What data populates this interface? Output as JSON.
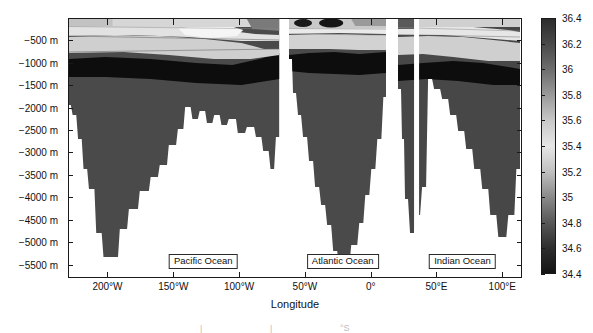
{
  "chart_data": {
    "type": "heatmap",
    "title": "",
    "subtitle": "",
    "xlabel": "Longitude",
    "ylabel": "",
    "colorbar_label": "",
    "grid": false,
    "legend_position": "right-colorbar",
    "xlim": [
      -230,
      115
    ],
    "ylim": [
      -5800,
      0
    ],
    "x_ticks": [
      {
        "value": -200,
        "label": "200°W"
      },
      {
        "value": -150,
        "label": "150°W"
      },
      {
        "value": -100,
        "label": "100°W"
      },
      {
        "value": -50,
        "label": "50°W"
      },
      {
        "value": 0,
        "label": "0°"
      },
      {
        "value": 50,
        "label": "50°E"
      },
      {
        "value": 100,
        "label": "100°E"
      }
    ],
    "y_ticks": [
      {
        "value": -500,
        "label": "−500 m"
      },
      {
        "value": -1000,
        "label": "−1000 m"
      },
      {
        "value": -1500,
        "label": "−1500 m"
      },
      {
        "value": -2000,
        "label": "−2000 m"
      },
      {
        "value": -2500,
        "label": "−2500 m"
      },
      {
        "value": -3000,
        "label": "−3000 m"
      },
      {
        "value": -3500,
        "label": "−3500 m"
      },
      {
        "value": -4000,
        "label": "−4000 m"
      },
      {
        "value": -4500,
        "label": "−4500 m"
      },
      {
        "value": -5000,
        "label": "−5000 m"
      },
      {
        "value": -5500,
        "label": "−5500 m"
      }
    ],
    "colorbar": {
      "ticks": [
        36.4,
        36.2,
        36,
        35.8,
        35.6,
        35.4,
        35.2,
        35,
        34.8,
        34.6,
        34.4
      ],
      "tick_labels": [
        "36.4",
        "36.2",
        "36",
        "35.8",
        "35.6",
        "35.4",
        "35.2",
        "35",
        "34.8",
        "34.6",
        "34.4"
      ],
      "vmin": 34.4,
      "vmax": 36.4,
      "colormap": "grayscale-nonmonotonic",
      "stops": [
        {
          "value": 36.4,
          "color": "#2c2c2c"
        },
        {
          "value": 36.2,
          "color": "#4a4a4a"
        },
        {
          "value": 36.0,
          "color": "#6e6e6e"
        },
        {
          "value": 35.8,
          "color": "#9a9a9a"
        },
        {
          "value": 35.6,
          "color": "#c8c8c8"
        },
        {
          "value": 35.4,
          "color": "#e6e6e6"
        },
        {
          "value": 35.2,
          "color": "#c0c0c0"
        },
        {
          "value": 35.0,
          "color": "#8a8a8a"
        },
        {
          "value": 34.8,
          "color": "#585858"
        },
        {
          "value": 34.6,
          "color": "#2e2e2e"
        },
        {
          "value": 34.4,
          "color": "#141414"
        }
      ]
    },
    "panels": [
      {
        "name": "Pacific Ocean",
        "label": "Pacific Ocean",
        "x_start": -230,
        "x_end": -70,
        "label_x": -128,
        "label_y": -5250,
        "max_depth_m": 5550,
        "water_mass_bands": [
          {
            "depth_top_m": 0,
            "depth_bottom_m": 150,
            "salinity": 35.0
          },
          {
            "depth_top_m": 150,
            "depth_bottom_m": 500,
            "salinity": 35.4
          },
          {
            "depth_top_m": 500,
            "depth_bottom_m": 800,
            "salinity": 34.9
          },
          {
            "depth_top_m": 800,
            "depth_bottom_m": 1250,
            "salinity": 34.45
          },
          {
            "depth_top_m": 1250,
            "depth_bottom_m": 5550,
            "salinity": 34.7
          }
        ]
      },
      {
        "name": "Atlantic Ocean",
        "label": "Atlantic Ocean",
        "x_start": -63,
        "x_end": 11,
        "label_x": -22,
        "label_y": -5250,
        "max_depth_m": 5500,
        "water_mass_bands": [
          {
            "depth_top_m": 0,
            "depth_bottom_m": 120,
            "salinity": 36.3
          },
          {
            "depth_top_m": 120,
            "depth_bottom_m": 420,
            "salinity": 35.45
          },
          {
            "depth_top_m": 420,
            "depth_bottom_m": 700,
            "salinity": 35.0
          },
          {
            "depth_top_m": 700,
            "depth_bottom_m": 1150,
            "salinity": 34.45
          },
          {
            "depth_top_m": 1150,
            "depth_bottom_m": 5500,
            "salinity": 34.75
          }
        ]
      },
      {
        "name": "Indian Ocean",
        "label": "Indian Ocean",
        "x_start": 20,
        "x_end": 113,
        "label_x": 69,
        "label_y": -5250,
        "max_depth_m": 5300,
        "water_mass_bands": [
          {
            "depth_top_m": 0,
            "depth_bottom_m": 110,
            "salinity": 35.5
          },
          {
            "depth_top_m": 110,
            "depth_bottom_m": 480,
            "salinity": 35.45
          },
          {
            "depth_top_m": 480,
            "depth_bottom_m": 900,
            "salinity": 34.9
          },
          {
            "depth_top_m": 900,
            "depth_bottom_m": 1300,
            "salinity": 34.45
          },
          {
            "depth_top_m": 1300,
            "depth_bottom_m": 5300,
            "salinity": 34.75
          }
        ]
      }
    ]
  },
  "axis": {
    "x_title": "Longitude"
  }
}
